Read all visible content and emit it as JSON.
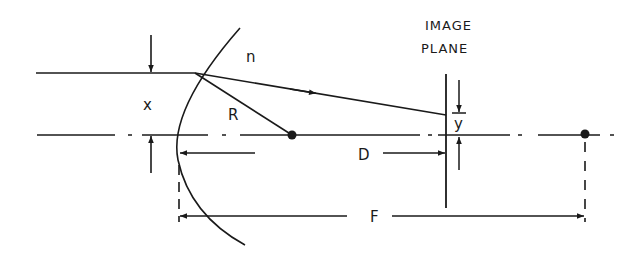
{
  "labels": {
    "index": "n",
    "height": "x",
    "radius": "R",
    "image_height": "y",
    "distance": "D",
    "focal": "F",
    "image_plane_line1": "IMAGE",
    "image_plane_line2": "PLANE"
  },
  "colors": {
    "ink": "#1a1a1a",
    "background": "#ffffff"
  },
  "elements": {
    "incoming_ray": "horizontal ray at height x",
    "refracting_surface": "spherical arc, radius R, index n",
    "center_of_curvature": "dot on optical axis",
    "focal_point": "dot on optical axis",
    "optical_axis": "dash-dot line",
    "image_plane": "vertical line"
  }
}
